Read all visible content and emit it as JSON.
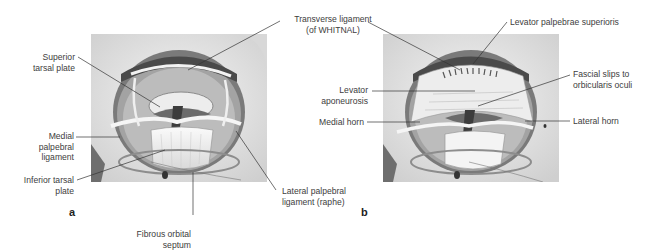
{
  "figure": {
    "panels": [
      {
        "letter": "a",
        "labels": {
          "transverse_ligament_1": "Transverse ligament",
          "transverse_ligament_2": "(of WHITNAL)",
          "superior_tarsal_1": "Superior",
          "superior_tarsal_2": "tarsal plate",
          "medial_palpebral_1": "Medial",
          "medial_palpebral_2": "palpebral",
          "medial_palpebral_3": "ligament",
          "inferior_tarsal_1": "Inferior tarsal",
          "inferior_tarsal_2": "plate",
          "fibrous_septum_1": "Fibrous orbital",
          "fibrous_septum_2": "septum",
          "lateral_palpebral_1": "Lateral palpebral",
          "lateral_palpebral_2": "ligament (raphe)"
        }
      },
      {
        "letter": "b",
        "labels": {
          "levator_palpebrae": "Levator palpebrae superioris",
          "levator_aponeurosis_1": "Levator",
          "levator_aponeurosis_2": "aponeurosis",
          "medial_horn": "Medial horn",
          "fascial_slips_1": "Fascial slips to",
          "fascial_slips_2": "orbicularis oculi",
          "lateral_horn": "Lateral horn"
        }
      }
    ],
    "colors": {
      "background": "#ffffff",
      "bone": "#e6e6e6",
      "orbit_rim": "#8a8a8a",
      "shadow": "#5a5a5a",
      "ligament": "#f2f2f2",
      "leader_line": "#333333",
      "text": "#3d3d3d"
    }
  }
}
